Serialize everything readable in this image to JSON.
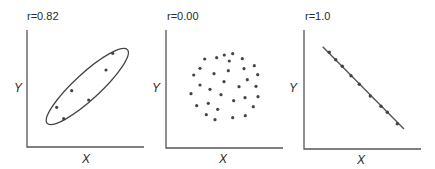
{
  "colors": {
    "axis": "#555555",
    "point": "#444444",
    "background": "#ffffff"
  },
  "chart_data": [
    {
      "type": "scatter",
      "title": "r=0.82",
      "xlabel": "X",
      "ylabel": "Y",
      "annotation": "ellipse enclosing all points",
      "grid": false,
      "points": [
        {
          "x": 112.7,
          "y": 53.3
        },
        {
          "x": 106,
          "y": 70
        },
        {
          "x": 71.7,
          "y": 90.7
        },
        {
          "x": 88.7,
          "y": 100
        },
        {
          "x": 56.7,
          "y": 107.3
        },
        {
          "x": 63.7,
          "y": 118.7
        }
      ],
      "ellipse": {
        "cx": 87.3,
        "cy": 86.5,
        "rx": 54.5,
        "ry": 13,
        "angle": -42.6
      },
      "axes": {
        "x0": 27,
        "y0": 147,
        "xTop": 30,
        "xEnd": 144
      }
    },
    {
      "type": "scatter",
      "title": "r=0.00",
      "xlabel": "X",
      "ylabel": "Y",
      "grid": false,
      "points": [
        {
          "x": 204.7,
          "y": 59
        },
        {
          "x": 216.7,
          "y": 57.7
        },
        {
          "x": 224.3,
          "y": 55
        },
        {
          "x": 232.7,
          "y": 53.7
        },
        {
          "x": 229.3,
          "y": 61
        },
        {
          "x": 242.3,
          "y": 58.7
        },
        {
          "x": 200,
          "y": 68.3
        },
        {
          "x": 228.3,
          "y": 70.7
        },
        {
          "x": 244,
          "y": 68.7
        },
        {
          "x": 254.3,
          "y": 65.7
        },
        {
          "x": 193.7,
          "y": 75
        },
        {
          "x": 214,
          "y": 73.7
        },
        {
          "x": 257.7,
          "y": 74.7
        },
        {
          "x": 224,
          "y": 81.7
        },
        {
          "x": 247.3,
          "y": 79.7
        },
        {
          "x": 200,
          "y": 85
        },
        {
          "x": 210,
          "y": 89.3
        },
        {
          "x": 239,
          "y": 86.7
        },
        {
          "x": 256,
          "y": 86.3
        },
        {
          "x": 191,
          "y": 93.7
        },
        {
          "x": 221,
          "y": 94.7
        },
        {
          "x": 245,
          "y": 97.7
        },
        {
          "x": 258,
          "y": 96.7
        },
        {
          "x": 233.7,
          "y": 100.7
        },
        {
          "x": 196.7,
          "y": 105.7
        },
        {
          "x": 208.3,
          "y": 103.3
        },
        {
          "x": 217.7,
          "y": 109.3
        },
        {
          "x": 253.3,
          "y": 106.7
        },
        {
          "x": 206.3,
          "y": 114.7
        },
        {
          "x": 215,
          "y": 119.7
        },
        {
          "x": 232.7,
          "y": 117.7
        },
        {
          "x": 245.3,
          "y": 115.7
        }
      ],
      "axes": {
        "x0": 166,
        "y0": 148,
        "xTop": 30,
        "xEnd": 283
      }
    },
    {
      "type": "scatter",
      "title": "r=1.0",
      "xlabel": "X",
      "ylabel": "Y",
      "annotation": "straight fit line through all points (perfect negative linear relation)",
      "grid": false,
      "points": [
        {
          "x": 329.3,
          "y": 52.3
        },
        {
          "x": 335.7,
          "y": 59.7
        },
        {
          "x": 342.3,
          "y": 66.3
        },
        {
          "x": 351,
          "y": 75.7
        },
        {
          "x": 359.3,
          "y": 84.3
        },
        {
          "x": 370.3,
          "y": 96
        },
        {
          "x": 381,
          "y": 106.3
        },
        {
          "x": 387.3,
          "y": 112.3
        },
        {
          "x": 397.3,
          "y": 123.7
        }
      ],
      "line": {
        "x1": 322.7,
        "y1": 46.7,
        "x2": 404,
        "y2": 129
      },
      "axes": {
        "x0": 304,
        "y0": 149,
        "xTop": 30,
        "xEnd": 421
      }
    }
  ]
}
